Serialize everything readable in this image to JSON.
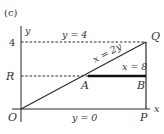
{
  "figure": {
    "part_label": "(c)",
    "axes": {
      "x_label": "x",
      "y_label": "y",
      "origin_label": "O",
      "y_tick_labels": [
        "4",
        "R"
      ]
    },
    "points": {
      "O": "O",
      "P": "P",
      "Q": "Q",
      "R": "R",
      "A": "A",
      "B": "B"
    },
    "lines": {
      "top_dashed": "y = 4",
      "bottom_axis": "y = 0",
      "diagonal": "x = 2y",
      "segment_ab": "x = 8"
    },
    "colors": {
      "stroke": "#2b2b2b",
      "text": "#333333",
      "background": "#ffffff"
    }
  }
}
